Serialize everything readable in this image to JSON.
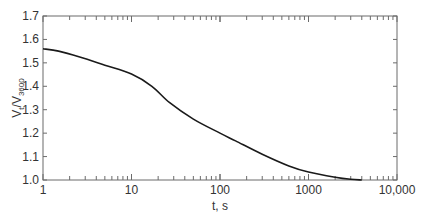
{
  "chart_data": {
    "type": "line",
    "title": "",
    "xlabel": "t, s",
    "ylabel_main": "V",
    "ylabel_sub1": "t",
    "ylabel_mid": "/V",
    "ylabel_sub2": "3600",
    "ylabel": "Vt/V3600",
    "xscale": "log",
    "xlim": [
      1,
      10000
    ],
    "ylim": [
      1.0,
      1.7
    ],
    "x_ticks": [
      1,
      10,
      100,
      1000,
      10000
    ],
    "x_tick_labels": [
      "1",
      "10",
      "100",
      "1000",
      "10,000"
    ],
    "y_ticks": [
      1.0,
      1.1,
      1.2,
      1.3,
      1.4,
      1.5,
      1.6,
      1.7
    ],
    "y_tick_labels": [
      "1.0",
      "1.1",
      "1.2",
      "1.3",
      "1.4",
      "1.5",
      "1.6",
      "1.7"
    ],
    "grid": false,
    "legend": null,
    "series": [
      {
        "name": "Vt/V3600",
        "color": "#1a1a1a",
        "x": [
          1,
          1.5,
          2.6,
          5,
          10,
          17,
          27,
          50,
          100,
          150,
          300,
          600,
          1000,
          2000,
          3000,
          4000
        ],
        "y": [
          1.56,
          1.55,
          1.525,
          1.49,
          1.452,
          1.4,
          1.33,
          1.26,
          1.2,
          1.167,
          1.11,
          1.06,
          1.034,
          1.012,
          1.003,
          1.0
        ]
      }
    ]
  }
}
